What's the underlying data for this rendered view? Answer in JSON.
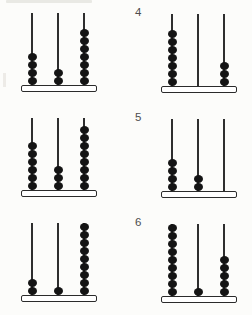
{
  "page": {
    "background": "#fcfcfa",
    "type": "abacus-worksheet"
  },
  "colors": {
    "bead": "#141414",
    "rod": "#2e2e2e",
    "base_fill": "#ffffff",
    "base_border": "#2b2b2b",
    "label": "#4d4d4d"
  },
  "problems": [
    {
      "position": "top-left",
      "label": "",
      "rod_beads": [
        4,
        2,
        7
      ]
    },
    {
      "position": "top-right",
      "label": "4",
      "rod_beads": [
        7,
        0,
        3
      ]
    },
    {
      "position": "middle-left",
      "label": "",
      "rod_beads": [
        6,
        3,
        8
      ]
    },
    {
      "position": "middle-right",
      "label": "5",
      "rod_beads": [
        4,
        2,
        0
      ]
    },
    {
      "position": "bottom-left",
      "label": "",
      "rod_beads": [
        2,
        1,
        9
      ]
    },
    {
      "position": "bottom-right",
      "label": "6",
      "rod_beads": [
        9,
        1,
        5
      ]
    }
  ]
}
